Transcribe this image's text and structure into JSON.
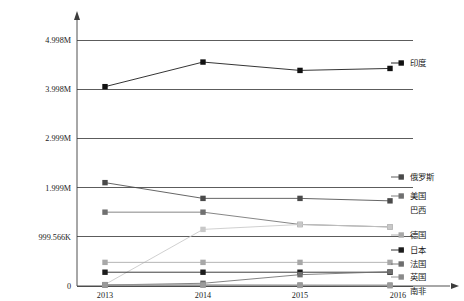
{
  "chart_data": {
    "type": "line",
    "title": "",
    "xlabel": "年份",
    "ylabel": "",
    "categories": [
      "2013",
      "2014",
      "2015",
      "2016"
    ],
    "x": [
      2013,
      2014,
      2015,
      2016
    ],
    "xtick_labels": [
      "2013",
      "2014",
      "2015",
      "2016"
    ],
    "ytick_labels": [
      "0",
      "999.566K",
      "1.999M",
      "2.999M",
      "3.998M",
      "4.998M"
    ],
    "ytick_values": [
      0,
      999566,
      1999000,
      2999000,
      3998000,
      4998000
    ],
    "ylim": [
      0,
      4998000
    ],
    "grid": true,
    "legend_position": "right",
    "series": [
      {
        "name": "印度",
        "color": "#111111",
        "marker": "square",
        "values": [
          4050000,
          4550000,
          4380000,
          4420000
        ]
      },
      {
        "name": "俄罗斯",
        "color": "#4a4a4a",
        "marker": "square",
        "values": [
          2100000,
          1780000,
          1780000,
          1730000
        ]
      },
      {
        "name": "美国",
        "color": "#707070",
        "marker": "square",
        "values": [
          1500000,
          1500000,
          1250000,
          1200000
        ]
      },
      {
        "name": "巴西",
        "color": "#c8c8c8",
        "marker": "square",
        "values": [
          30000,
          1150000,
          1250000,
          1200000
        ]
      },
      {
        "name": "德国",
        "color": "#a8a8a8",
        "marker": "square",
        "values": [
          480000,
          480000,
          480000,
          480000
        ]
      },
      {
        "name": "日本",
        "color": "#1c1c1c",
        "marker": "square",
        "values": [
          280000,
          280000,
          280000,
          280000
        ]
      },
      {
        "name": "法国",
        "color": "#6e6e6e",
        "marker": "square",
        "values": [
          20000,
          55000,
          230000,
          290000
        ]
      },
      {
        "name": "英国",
        "color": "#8a8a8a",
        "marker": "square",
        "values": [
          20000,
          20000,
          20000,
          20000
        ]
      },
      {
        "name": "南非",
        "color": "#9a9a9a",
        "marker": "square",
        "values": [
          25000,
          20000,
          12000,
          5000
        ]
      }
    ]
  },
  "legend": {
    "entries": [
      {
        "label": "印度"
      },
      {
        "label": "俄罗斯"
      },
      {
        "label": "美国"
      },
      {
        "label": "巴西"
      },
      {
        "label": "德国"
      },
      {
        "label": "日本"
      },
      {
        "label": "法国"
      },
      {
        "label": "英国"
      },
      {
        "label": "南非"
      }
    ]
  },
  "axes": {
    "x_title": "年份",
    "y_ticks": [
      {
        "label": "4.998M"
      },
      {
        "label": "3.998M"
      },
      {
        "label": "2.999M"
      },
      {
        "label": "1.999M"
      },
      {
        "label": "999.566K"
      },
      {
        "label": "0"
      }
    ],
    "x_ticks": [
      {
        "label": "2013"
      },
      {
        "label": "2014"
      },
      {
        "label": "2015"
      },
      {
        "label": "2016"
      }
    ]
  }
}
